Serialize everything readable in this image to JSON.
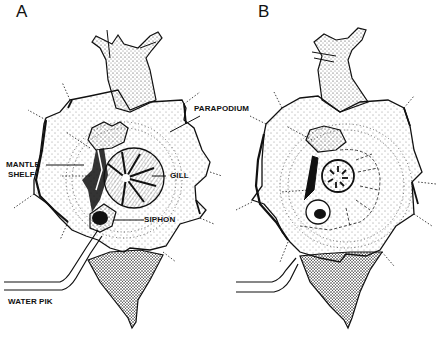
{
  "figure": {
    "panels": [
      {
        "letter": "A"
      },
      {
        "letter": "B"
      }
    ],
    "labels": {
      "parapodium": "PARAPODIUM",
      "mantle_line1": "MANTLE",
      "mantle_line2": "SHELF",
      "gill": "GILL",
      "siphon": "SIPHON",
      "water_pik": "WATER PIK"
    },
    "colors": {
      "ink": "#111111",
      "background": "#ffffff"
    }
  }
}
